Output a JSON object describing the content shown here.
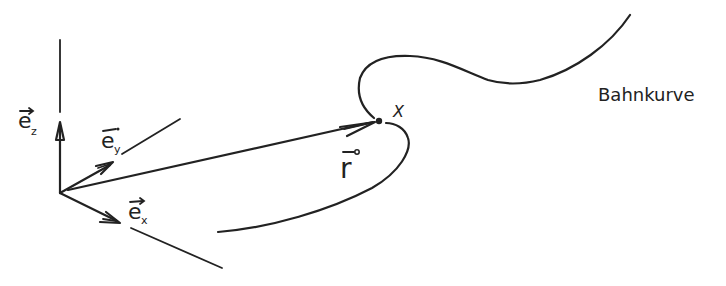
{
  "diagram": {
    "type": "position-vector-trajectory",
    "colors": {
      "ink": "#222222",
      "background": "#ffffff"
    },
    "labels": {
      "ez": "e",
      "ez_sub": "z",
      "ey": "e",
      "ey_sub": "y",
      "ex": "e",
      "ex_sub": "x",
      "r": "r",
      "point": "X",
      "curve": "Bahnkurve"
    },
    "elements": [
      {
        "id": "z-axis",
        "kind": "axis"
      },
      {
        "id": "y-axis",
        "kind": "axis"
      },
      {
        "id": "x-axis",
        "kind": "axis"
      },
      {
        "id": "unit-vector-ez",
        "kind": "arrow"
      },
      {
        "id": "unit-vector-ey",
        "kind": "arrow"
      },
      {
        "id": "unit-vector-ex",
        "kind": "arrow"
      },
      {
        "id": "position-vector-r",
        "kind": "arrow"
      },
      {
        "id": "point-x",
        "kind": "point"
      },
      {
        "id": "trajectory",
        "kind": "curve"
      }
    ]
  }
}
